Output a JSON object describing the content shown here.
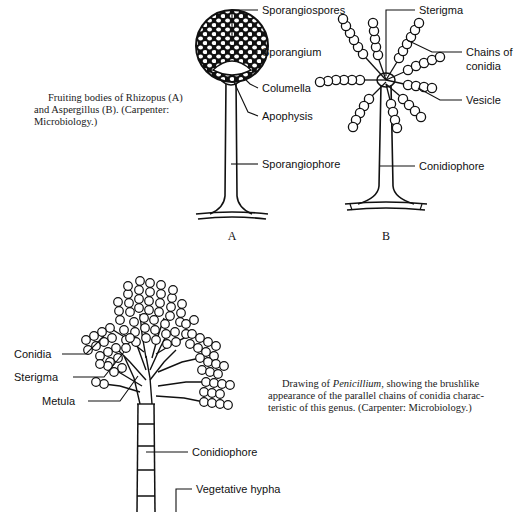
{
  "document": {
    "background_color": "#ffffff",
    "ink_color": "#000000",
    "title": "Fruiting bodies of Rhizopus, Aspergillus and Penicillium"
  },
  "captions": {
    "top_left": {
      "line1": "Fruiting bodies of Rhizopus (A)",
      "line2": "and  Aspergillus  (B).  (Carpenter:",
      "line3": "Microbiology.)"
    },
    "bottom_right": {
      "line1_prefix": "Drawing of ",
      "line1_italic": "Penicillium,",
      "line1_suffix": " showing the brushlike",
      "line2": "appearance of the parallel chains of conidia charac-",
      "line3": "teristic of this genus. (Carpenter: Microbiology.)"
    }
  },
  "figure_a": {
    "letter": "A",
    "name": "rhizopus",
    "labels": [
      {
        "id": "sporangiospores",
        "text": "Sporangiospores",
        "x": 262,
        "y": 14
      },
      {
        "id": "sporangium",
        "text": "Sporangium",
        "x": 262,
        "y": 56
      },
      {
        "id": "columella",
        "text": "Columella",
        "x": 262,
        "y": 92
      },
      {
        "id": "apophysis",
        "text": "Apophysis",
        "x": 262,
        "y": 120
      },
      {
        "id": "sporangiophore",
        "text": "Sporangiophore",
        "x": 262,
        "y": 168
      }
    ]
  },
  "figure_b": {
    "letter": "B",
    "name": "aspergillus",
    "labels": [
      {
        "id": "sterigma",
        "text": "Sterigma",
        "x": 419,
        "y": 14
      },
      {
        "id": "chains-of-conidia-line1",
        "text": "Chains of",
        "x": 466,
        "y": 54
      },
      {
        "id": "chains-of-conidia-line2",
        "text": "conidia",
        "x": 466,
        "y": 68
      },
      {
        "id": "vesicle",
        "text": "Vesicle",
        "x": 466,
        "y": 104
      },
      {
        "id": "conidiophore",
        "text": "Conidiophore",
        "x": 419,
        "y": 170
      }
    ]
  },
  "figure_c": {
    "name": "penicillium",
    "labels": [
      {
        "id": "conidia",
        "text": "Conidia",
        "x": 14,
        "y": 358
      },
      {
        "id": "sterigma",
        "text": "Sterigma",
        "x": 14,
        "y": 381
      },
      {
        "id": "metula",
        "text": "Metula",
        "x": 42,
        "y": 405
      },
      {
        "id": "conidiophore",
        "text": "Conidiophore",
        "x": 192,
        "y": 456
      },
      {
        "id": "vegetative-hypha",
        "text": "Vegetative hypha",
        "x": 196,
        "y": 493
      }
    ]
  }
}
